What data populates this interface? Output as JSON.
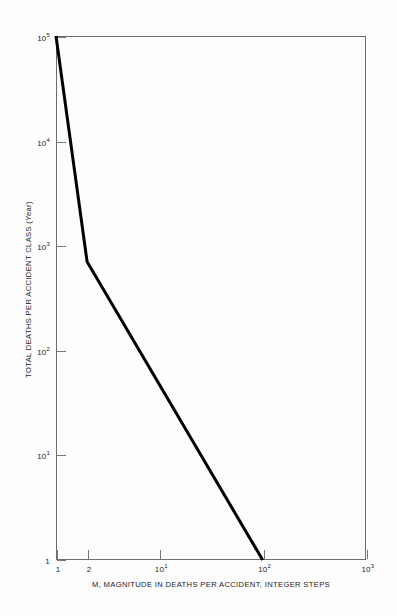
{
  "figure": {
    "background_color": "#fdfdfd",
    "frame_color": "#6e6e6e",
    "line_color": "#000000"
  },
  "axes": {
    "x": {
      "title": "M, MAGNITUDE IN DEATHS PER ACCIDENT, INTEGER STEPS",
      "scale": "log",
      "min": 1,
      "max": 1000,
      "ticks": [
        {
          "value": 1,
          "mantissa": "1",
          "exponent": ""
        },
        {
          "value": 2,
          "mantissa": "2",
          "exponent": ""
        },
        {
          "value": 10,
          "mantissa": "10",
          "exponent": "1"
        },
        {
          "value": 100,
          "mantissa": "10",
          "exponent": "2"
        },
        {
          "value": 1000,
          "mantissa": "10",
          "exponent": "3"
        }
      ]
    },
    "y": {
      "title": "TOTAL DEATHS PER ACCIDENT CLASS (Year)",
      "scale": "log",
      "min": 1,
      "max": 100000,
      "ticks": [
        {
          "value": 100000,
          "mantissa": "10",
          "exponent": "5"
        },
        {
          "value": 10000,
          "mantissa": "10",
          "exponent": "4"
        },
        {
          "value": 1000,
          "mantissa": "10",
          "exponent": "3"
        },
        {
          "value": 100,
          "mantissa": "10",
          "exponent": "2"
        },
        {
          "value": 10,
          "mantissa": "10",
          "exponent": "1"
        },
        {
          "value": 1,
          "mantissa": "1",
          "exponent": ""
        }
      ]
    }
  },
  "chart_data": {
    "type": "line",
    "title": "",
    "subtitle": "",
    "xlabel": "M, MAGNITUDE IN DEATHS PER ACCIDENT, INTEGER STEPS",
    "ylabel": "TOTAL DEATHS PER ACCIDENT CLASS (Year)",
    "xscale": "log",
    "yscale": "log",
    "xlim": [
      1,
      1000
    ],
    "ylim": [
      1,
      100000
    ],
    "grid": false,
    "legend": null,
    "annotations": [],
    "series": [
      {
        "name": "Total deaths per accident class",
        "color": "#000000",
        "linewidth": 3,
        "x": [
          1,
          2,
          100
        ],
        "y": [
          100000,
          700,
          1
        ]
      }
    ]
  }
}
